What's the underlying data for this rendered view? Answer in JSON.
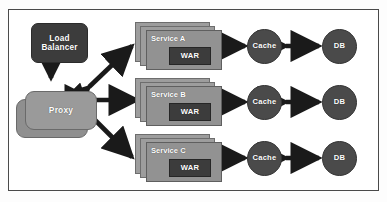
{
  "diagram": {
    "border_color": "#4a4a4a",
    "background": "#ffffff",
    "colors": {
      "dark_node": "#3c3c3c",
      "mid_node": "#929292",
      "circle_node": "#4a4a4a",
      "arrow": "#1a1a1a",
      "label_text": "#ffffff"
    },
    "nodes": {
      "load_balancer": {
        "label": "Load Balancer",
        "line1": "Load",
        "line2": "Balancer",
        "shape": "rounded-rect",
        "fill": "#3c3c3c"
      },
      "proxy": {
        "label": "Proxy",
        "shape": "stacked-rounded-rect",
        "fill": "#9a9a9a"
      }
    },
    "rows": [
      {
        "service": {
          "label": "Service A",
          "artifact": "WAR",
          "shape": "stacked-rect"
        },
        "cache": {
          "label": "Cache",
          "shape": "circle"
        },
        "db": {
          "label": "DB",
          "shape": "circle"
        }
      },
      {
        "service": {
          "label": "Service B",
          "artifact": "WAR",
          "shape": "stacked-rect"
        },
        "cache": {
          "label": "Cache",
          "shape": "circle"
        },
        "db": {
          "label": "DB",
          "shape": "circle"
        }
      },
      {
        "service": {
          "label": "Service C",
          "artifact": "WAR",
          "shape": "stacked-rect"
        },
        "cache": {
          "label": "Cache",
          "shape": "circle"
        },
        "db": {
          "label": "DB",
          "shape": "circle"
        }
      }
    ],
    "connections": [
      {
        "from": "load_balancer",
        "to": "proxy",
        "style": "single-arrow",
        "direction": "down"
      },
      {
        "from": "proxy",
        "to": "Service A",
        "style": "double-arrow",
        "direction": "diagonal-up-right"
      },
      {
        "from": "proxy",
        "to": "Service B",
        "style": "double-arrow",
        "direction": "horizontal"
      },
      {
        "from": "proxy",
        "to": "Service C",
        "style": "double-arrow",
        "direction": "diagonal-down-right"
      },
      {
        "from": "Service A",
        "to": "Cache",
        "style": "double-arrow",
        "direction": "horizontal"
      },
      {
        "from": "Cache",
        "to": "DB",
        "style": "double-arrow",
        "direction": "horizontal"
      },
      {
        "from": "Service B",
        "to": "Cache",
        "style": "double-arrow",
        "direction": "horizontal"
      },
      {
        "from": "Cache",
        "to": "DB",
        "style": "double-arrow",
        "direction": "horizontal"
      },
      {
        "from": "Service C",
        "to": "Cache",
        "style": "double-arrow",
        "direction": "horizontal"
      },
      {
        "from": "Cache",
        "to": "DB",
        "style": "double-arrow",
        "direction": "horizontal"
      }
    ]
  }
}
